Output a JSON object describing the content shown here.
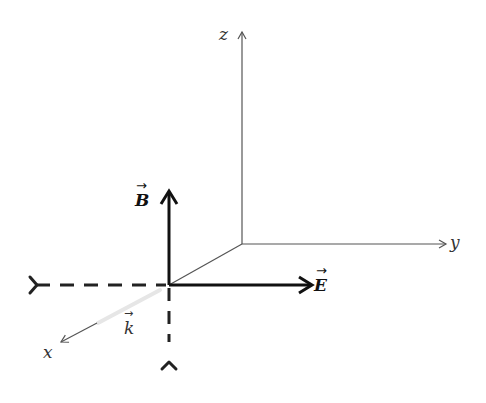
{
  "diagram": {
    "type": "3d-coordinate-axes-electromagnetic-wave",
    "axes": {
      "x_label": "x",
      "y_label": "y",
      "z_label": "z"
    },
    "vectors": {
      "B_label": "B",
      "E_label": "E",
      "k_label": "k",
      "arrow_accent": "→"
    },
    "colors": {
      "axis_line": "#555555",
      "vector_line": "#111111",
      "background": "#ffffff"
    }
  }
}
